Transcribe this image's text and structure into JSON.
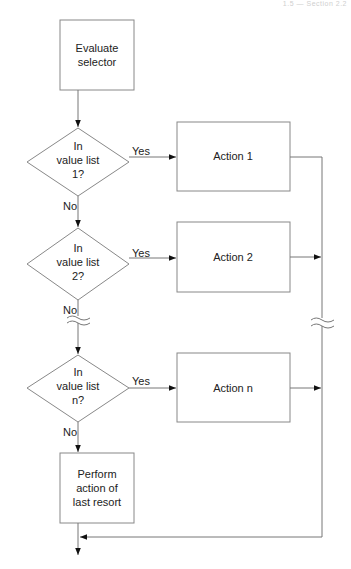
{
  "header": {
    "text": "1.5 — Section 2.2"
  },
  "flowchart": {
    "start_box": {
      "lines": [
        "Evaluate",
        "selector"
      ]
    },
    "decisions": [
      {
        "lines": [
          "In",
          "value list",
          "1?"
        ],
        "yes_label": "Yes",
        "no_label": "No"
      },
      {
        "lines": [
          "In",
          "value list",
          "2?"
        ],
        "yes_label": "Yes",
        "no_label": "No"
      },
      {
        "lines": [
          "In",
          "value list",
          "n?"
        ],
        "yes_label": "Yes",
        "no_label": "No"
      }
    ],
    "actions": [
      {
        "label": "Action 1"
      },
      {
        "label": "Action 2"
      },
      {
        "label": "Action n"
      }
    ],
    "last_resort_box": {
      "lines": [
        "Perform",
        "action of",
        "last resort"
      ]
    },
    "colors": {
      "line": "#777777",
      "arrow": "#111111",
      "text": "#222222"
    }
  }
}
